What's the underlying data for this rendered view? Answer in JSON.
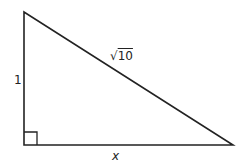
{
  "diagram": {
    "type": "right-triangle",
    "stroke_color": "#222222",
    "background": "#ffffff",
    "vertices": {
      "top": [
        24,
        12
      ],
      "right_angle": [
        24,
        145
      ],
      "right": [
        233,
        145
      ]
    },
    "right_angle_marker_size": 13,
    "labels": {
      "vertical_leg": "1",
      "hypotenuse_radical": "√",
      "hypotenuse_radicand": "10",
      "horizontal_leg": "x"
    }
  }
}
